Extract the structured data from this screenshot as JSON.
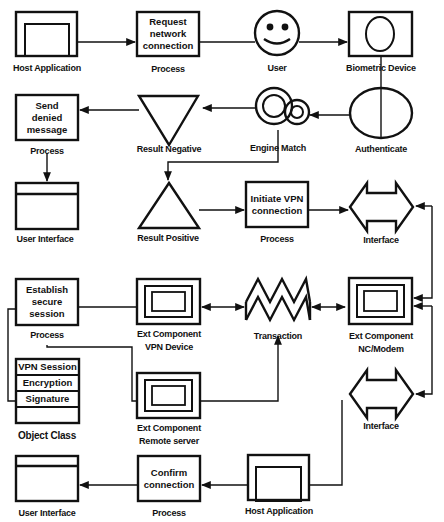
{
  "diagram": {
    "type": "flowchart",
    "stroke_color": "#111111",
    "background": "#ffffff",
    "nodes": {
      "host_app_top": {
        "label": "Host Application"
      },
      "request_process": {
        "text": [
          "Request",
          "network",
          "connection"
        ],
        "label": "Process"
      },
      "user": {
        "label": "User"
      },
      "biometric": {
        "label": "Biometric Device"
      },
      "send_denied": {
        "text": [
          "Send",
          "denied",
          "message"
        ],
        "label": "Process"
      },
      "result_negative": {
        "label": "Result Negative"
      },
      "engine_match": {
        "label": "Engine Match"
      },
      "authenticate": {
        "label": "Authenticate"
      },
      "ui_top": {
        "label": "User Interface"
      },
      "result_positive": {
        "label": "Result Positive"
      },
      "initiate_vpn": {
        "text": [
          "Initiate VPN",
          "connection"
        ],
        "label": "Process"
      },
      "interface_top": {
        "label": "Interface"
      },
      "establish_session": {
        "text": [
          "Establish",
          "secure",
          "session"
        ],
        "label": "Process"
      },
      "vpn_device": {
        "label": [
          "Ext Component",
          "VPN Device"
        ]
      },
      "transaction": {
        "label": "Transaction"
      },
      "nc_modem": {
        "label": [
          "Ext Component",
          "NC/Modem"
        ]
      },
      "object_class": {
        "rows": [
          "VPN Session",
          "Encryption",
          "Signature",
          ""
        ],
        "label": "Object Class"
      },
      "remote_server": {
        "label": [
          "Ext Component",
          "Remote server"
        ]
      },
      "interface_bottom": {
        "label": "Interface"
      },
      "ui_bottom": {
        "label": "User Interface"
      },
      "confirm_process": {
        "text": [
          "Confirm",
          "connection"
        ],
        "label": "Process"
      },
      "host_app_bottom": {
        "label": "Host Application"
      }
    },
    "edges": [
      {
        "from": "Host Application",
        "to": "Process (Request network connection)"
      },
      {
        "from": "Process (Request network connection)",
        "to": "User"
      },
      {
        "from": "User",
        "to": "Biometric Device"
      },
      {
        "from": "Biometric Device",
        "to": "Authenticate"
      },
      {
        "from": "Authenticate",
        "to": "Engine Match"
      },
      {
        "from": "Engine Match",
        "to": "Result Negative"
      },
      {
        "from": "Result Negative",
        "to": "Process (Send denied message)"
      },
      {
        "from": "Process (Send denied message)",
        "to": "User Interface"
      },
      {
        "from": "Engine Match",
        "to": "Result Positive"
      },
      {
        "from": "Result Positive",
        "to": "Process (Initiate VPN connection)"
      },
      {
        "from": "Process (Initiate VPN connection)",
        "to": "Interface"
      },
      {
        "from": "Interface",
        "to": "Ext Component NC/Modem",
        "bidirectional": true
      },
      {
        "from": "Ext Component NC/Modem",
        "to": "Transaction",
        "bidirectional": true
      },
      {
        "from": "Transaction",
        "to": "Ext Component VPN Device",
        "bidirectional": true
      },
      {
        "from": "Process (Establish secure session)",
        "to": "Ext Component VPN Device"
      },
      {
        "from": "Process (Establish secure session)",
        "to": "Object Class"
      },
      {
        "from": "Process (Establish secure session)",
        "to": "Ext Component Remote server"
      },
      {
        "from": "Ext Component Remote server",
        "to": "Transaction"
      },
      {
        "from": "Ext Component NC/Modem",
        "to": "Interface (bottom)",
        "bidirectional": true
      },
      {
        "from": "Interface (bottom)",
        "to": "Host Application (bottom)"
      },
      {
        "from": "Host Application (bottom)",
        "to": "Process (Confirm connection)"
      },
      {
        "from": "Process (Confirm connection)",
        "to": "User Interface (bottom)"
      }
    ]
  }
}
